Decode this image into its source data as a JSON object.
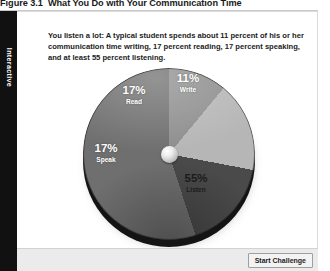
{
  "figure": {
    "number": "Figure 3.1",
    "title": "What You Do with Your Communication Time"
  },
  "side_tab": {
    "label": "Interactive"
  },
  "intro": {
    "text": "You listen a lot: A typical student spends about 11 percent of his or her communication time writing, 17 percent reading, 17 percent speaking, and at least 55 percent listening."
  },
  "labels": {
    "write_pct": "11%",
    "write_name": "Write",
    "read_pct": "17%",
    "read_name": "Read",
    "speak_pct": "17%",
    "speak_name": "Speak",
    "listen_pct": "55%",
    "listen_name": "Listen"
  },
  "footer": {
    "start_button": "Start Challenge"
  },
  "chart_data": {
    "type": "pie",
    "title": "What You Do with Your Communication Time",
    "categories": [
      "Write",
      "Read",
      "Speak",
      "Listen"
    ],
    "values": [
      11,
      17,
      17,
      55
    ],
    "unit": "percent",
    "data_labels": [
      "11%",
      "17%",
      "17%",
      "55%"
    ],
    "colors": [
      "#8e8e8e",
      "#b6b6b6",
      "#4a4a4a",
      "#6f6f6f"
    ],
    "label_text_colors": [
      "#ffffff",
      "#ffffff",
      "#ffffff",
      "#1b1b1b"
    ],
    "start_angle_deg": 0,
    "direction": "clockwise",
    "legend": "none",
    "grid": false,
    "style": "3d-disc",
    "hub": "sphere"
  }
}
